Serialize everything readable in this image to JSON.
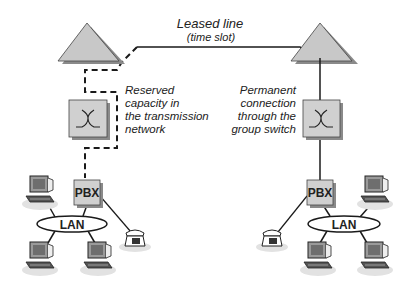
{
  "diagram": {
    "title": "Leased line",
    "subtitle": "(time slot)",
    "left_note": [
      "Reserved",
      "capacity in",
      "the transmission",
      "network"
    ],
    "right_note": [
      "Permanent",
      "connection",
      "through the",
      "group switch"
    ],
    "left_site": {
      "pbx_label": "PBX",
      "lan_label": "LAN",
      "computers": 3,
      "telephones": 1
    },
    "right_site": {
      "pbx_label": "PBX",
      "lan_label": "LAN",
      "computers": 3,
      "telephones": 1
    },
    "colors": {
      "node_fill": "#c8c8c8",
      "shadow": "#8a8a8a",
      "line": "#1a1a1a",
      "background": "#ffffff"
    }
  }
}
